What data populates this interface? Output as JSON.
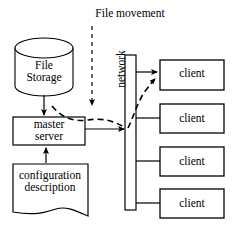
{
  "diagram": {
    "title": "File movement",
    "width": 234,
    "height": 230,
    "stroke_color": "#000000",
    "fill_color": "#ffffff",
    "annotations": {
      "file_movement_label": "File movement"
    },
    "nodes": {
      "file_storage": {
        "label": "File\nStorage",
        "shape": "cylinder"
      },
      "master_server": {
        "label": "master\nserver",
        "shape": "rectangle"
      },
      "configuration_description": {
        "label": "configuration\ndescription",
        "shape": "document"
      },
      "network": {
        "label": "network",
        "shape": "vertical-bar",
        "orientation": "rotated-90"
      }
    },
    "clients": [
      {
        "label": "client"
      },
      {
        "label": "client"
      },
      {
        "label": "client"
      },
      {
        "label": "client"
      }
    ],
    "edges": [
      {
        "from": "file_storage",
        "to": "master_server",
        "style": "solid",
        "arrow": "single"
      },
      {
        "from": "configuration_description",
        "to": "master_server",
        "style": "solid",
        "arrow": "single"
      },
      {
        "from": "master_server",
        "to": "network",
        "style": "solid",
        "arrow": "single"
      },
      {
        "from": "network",
        "to": "client-0",
        "style": "solid",
        "arrow": "single"
      },
      {
        "from": "network",
        "to": "client-1",
        "style": "solid",
        "arrow": "none"
      },
      {
        "from": "network",
        "to": "client-2",
        "style": "solid",
        "arrow": "none"
      },
      {
        "from": "network",
        "to": "client-3",
        "style": "solid",
        "arrow": "none"
      },
      {
        "from": "file-movement-label",
        "to": "flow-path",
        "style": "dashed",
        "arrow": "single"
      },
      {
        "from": "master_server",
        "to": "client-0",
        "style": "dashed",
        "arrow": "single",
        "note": "file movement path through network"
      }
    ]
  }
}
